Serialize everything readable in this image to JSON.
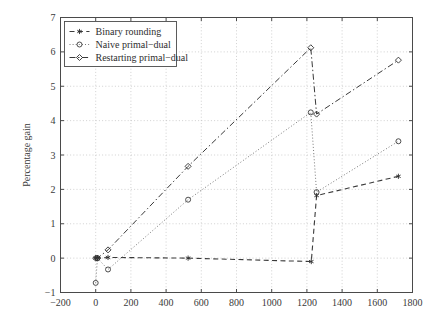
{
  "chart_data": {
    "type": "line",
    "title": "",
    "xlabel": "",
    "ylabel": "Percentage gain",
    "xlim": [
      -200,
      1800
    ],
    "ylim": [
      -1,
      7
    ],
    "xticks": [
      -200,
      0,
      200,
      400,
      600,
      800,
      1000,
      1200,
      1400,
      1600,
      1800
    ],
    "xtick_labels": [
      "−200",
      "0",
      "200",
      "400",
      "600",
      "800",
      "1000",
      "1200",
      "1400",
      "1600",
      "1800"
    ],
    "yticks": [
      -1,
      0,
      1,
      2,
      3,
      4,
      5,
      6,
      7
    ],
    "ytick_labels": [
      "−1",
      "0",
      "1",
      "2",
      "3",
      "4",
      "5",
      "6",
      "7"
    ],
    "grid": true,
    "legend_position": "upper-left",
    "series": [
      {
        "name": "Binary rounding",
        "marker": "star-icon",
        "linestyle": "dashed",
        "color": "#2e2e2e",
        "x": [
          0,
          10,
          70,
          525,
          1225,
          1255,
          1720
        ],
        "y": [
          0.0,
          0.0,
          0.02,
          0.0,
          -0.1,
          1.82,
          2.38
        ]
      },
      {
        "name": "Naive primal−dual",
        "marker": "circle-icon",
        "linestyle": "dotted",
        "color": "#3a3a3a",
        "x": [
          0,
          10,
          70,
          525,
          1222,
          1255,
          1720
        ],
        "y": [
          -0.72,
          0.0,
          -0.33,
          1.7,
          4.24,
          1.92,
          3.4
        ]
      },
      {
        "name": "Restarting primal−dual",
        "marker": "diamond-icon",
        "linestyle": "dashdot",
        "color": "#2e2e2e",
        "x": [
          0,
          10,
          70,
          525,
          1222,
          1255,
          1720
        ],
        "y": [
          0.0,
          0.0,
          0.24,
          2.67,
          6.12,
          4.19,
          5.76
        ]
      }
    ]
  },
  "legend": {
    "items": [
      {
        "label": "Binary rounding",
        "marker": "star-icon"
      },
      {
        "label": "Naive primal−dual",
        "marker": "circle-icon"
      },
      {
        "label": "Restarting primal−dual",
        "marker": "diamond-icon"
      }
    ]
  },
  "colors": {
    "axis": "#4a4a4a",
    "grid": "#bdbdbd",
    "text": "#3a3a3a",
    "background": "#ffffff"
  }
}
